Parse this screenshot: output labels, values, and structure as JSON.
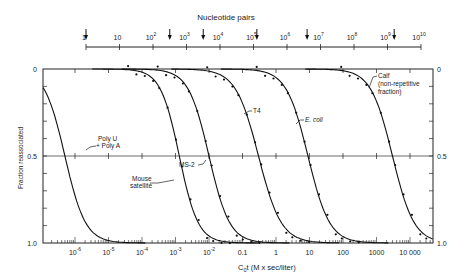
{
  "chart_data": {
    "type": "line",
    "title": "",
    "top_axis": {
      "label": "Nucleotide pairs",
      "ticks": [
        "1",
        "10",
        "10^2",
        "10^3",
        "10^4",
        "10^5",
        "10^6",
        "10^7",
        "10^8",
        "10^9",
        "10^10"
      ],
      "arrow_markers_log10": [
        0,
        2.5,
        3.5,
        5.1,
        6.6,
        9.2
      ]
    },
    "xlabel": "C0t (M x sec/liter)",
    "xscale": "log",
    "xlim": [
      5e-07,
      60000
    ],
    "x_ticks": [
      "10^-6",
      "10^-5",
      "10^-4",
      "10^-3",
      "10^-2",
      "0.1",
      "1",
      "10",
      "100",
      "1000",
      "10 000"
    ],
    "ylabel": "Fraction reassociated",
    "ylim": [
      0,
      1.0
    ],
    "y_inverted": true,
    "y_ticks": [
      "0",
      "0.5",
      "1.0"
    ],
    "grid": false,
    "reference_line_y": 0.5,
    "series": [
      {
        "name": "Poly U + Poly A",
        "midpoint_c0t": 5e-07,
        "points": false,
        "x": [
          3e-08,
          1e-07,
          3e-07,
          5e-07,
          1e-06,
          3e-06,
          1e-05,
          3e-05,
          0.0001
        ],
        "y": [
          0.03,
          0.12,
          0.35,
          0.5,
          0.66,
          0.84,
          0.94,
          0.98,
          1.0
        ]
      },
      {
        "name": "Mouse satellite",
        "midpoint_c0t": 0.0013,
        "points": true,
        "x": [
          0.0001,
          0.0003,
          0.0008,
          0.0013,
          0.003,
          0.006,
          0.01,
          0.015
        ],
        "y": [
          0.05,
          0.15,
          0.38,
          0.5,
          0.72,
          0.85,
          0.92,
          0.96
        ]
      },
      {
        "name": "MS-2",
        "midpoint_c0t": 0.01,
        "points": true,
        "x": [
          0.0008,
          0.002,
          0.005,
          0.01,
          0.03,
          0.1,
          0.3
        ],
        "y": [
          0.05,
          0.16,
          0.34,
          0.5,
          0.74,
          0.92,
          0.99
        ]
      },
      {
        "name": "T4",
        "midpoint_c0t": 0.3,
        "points": true,
        "x": [
          0.03,
          0.1,
          0.2,
          0.3,
          0.6,
          1,
          2,
          4
        ],
        "y": [
          0.04,
          0.2,
          0.38,
          0.5,
          0.68,
          0.78,
          0.88,
          0.92
        ]
      },
      {
        "name": "E. coli",
        "midpoint_c0t": 9,
        "points": true,
        "x": [
          1,
          3,
          9,
          20,
          50,
          100,
          200,
          300
        ],
        "y": [
          0.1,
          0.28,
          0.5,
          0.66,
          0.82,
          0.9,
          0.96,
          0.99
        ]
      },
      {
        "name": "Calf (non-repetitive fraction)",
        "midpoint_c0t": 3000,
        "points": true,
        "x": [
          30,
          100,
          300,
          1000,
          3000,
          6000,
          10000,
          20000
        ],
        "y": [
          0.0,
          0.02,
          0.1,
          0.28,
          0.5,
          0.66,
          0.76,
          0.88
        ]
      }
    ],
    "annotations": [
      "Poly U",
      "+ Poly A",
      "Mouse",
      "satellite",
      "MS-2",
      "T4",
      "E. coli",
      "Calf",
      "(non-repetitive",
      "fraction)"
    ]
  },
  "labels": {
    "top_title": "Nucleotide pairs",
    "top_ticks": [
      "1",
      "10",
      "10",
      "10",
      "10",
      "10",
      "10",
      "10",
      "10",
      "10",
      "10"
    ],
    "top_exps": [
      "",
      "",
      "2",
      "3",
      "4",
      "5",
      "6",
      "7",
      "8",
      "9",
      "10"
    ],
    "y_left": [
      "0",
      "0.5",
      "1.0"
    ],
    "y_right": [
      "0",
      "0.5",
      "1.0"
    ],
    "y_title": "Fraction reassociated",
    "x_ticks_base": [
      "10",
      "10",
      "10",
      "10",
      "10",
      "0.1",
      "1",
      "10",
      "100",
      "1000",
      "10 000"
    ],
    "x_ticks_exp": [
      "-6",
      "-5",
      "-4",
      "-3",
      "-2",
      "",
      "",
      "",
      "",
      "",
      ""
    ],
    "x_title_pre": "C",
    "x_title_sub": "0",
    "x_title_post": "t (M x sec/liter)",
    "poly1": "Poly U",
    "poly2": "+ Poly A",
    "mouse1": "Mouse",
    "mouse2": "satellite",
    "ms2": "MS-2",
    "t4": "T4",
    "ecoli": "E. coli",
    "calf1": "Calf",
    "calf2": "(non-repetitive",
    "calf3": "fraction)"
  }
}
